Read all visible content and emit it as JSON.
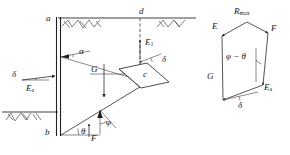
{
  "figure": {
    "stroke_color": "#2b2b2b",
    "background": "#ffffff"
  },
  "wall_diagram": {
    "name": "retaining-wall-diagram",
    "points": [
      {
        "id": "a",
        "label": "a",
        "x": 46,
        "y": 14,
        "desc": "top of wall"
      },
      {
        "id": "b",
        "label": "b",
        "x": 45,
        "y": 131,
        "desc": "toe of wall"
      },
      {
        "id": "c",
        "label": "c",
        "x": 143,
        "y": 76,
        "desc": "anchor head"
      },
      {
        "id": "d",
        "label": "d",
        "x": 140,
        "y": 12,
        "desc": "ground surface point"
      }
    ],
    "forces": [
      {
        "id": "Ea_left",
        "label": "E",
        "sub": "a",
        "x": 31,
        "y": 86,
        "desc": "active earth pressure on wall"
      },
      {
        "id": "G",
        "label": "G",
        "sub": "",
        "x": 93,
        "y": 69,
        "desc": "weight of soil wedge"
      },
      {
        "id": "E1",
        "label": "E",
        "sub": "1",
        "x": 148,
        "y": 44,
        "desc": "anchor force resultant"
      },
      {
        "id": "F",
        "label": "F",
        "sub": "",
        "x": 93,
        "y": 137,
        "desc": "reaction on slip plane"
      }
    ],
    "angles": [
      {
        "id": "alpha",
        "label": "α",
        "x": 79,
        "y": 54,
        "desc": "wedge angle at wall"
      },
      {
        "id": "delta_left",
        "label": "δ",
        "x": 26,
        "y": 71,
        "desc": "wall friction angle"
      },
      {
        "id": "delta_mid",
        "label": "δ",
        "x": 163,
        "y": 61,
        "desc": "anchor inclination"
      },
      {
        "id": "theta",
        "label": "θ",
        "x": 83,
        "y": 132,
        "desc": "slip surface angle"
      },
      {
        "id": "phi",
        "label": "φ",
        "x": 107,
        "y": 124,
        "desc": "internal friction angle"
      }
    ]
  },
  "force_polygon": {
    "name": "force-polygon",
    "vertices": [
      {
        "label": "E",
        "sub": "",
        "x": 213,
        "y": 26
      },
      {
        "label": "R",
        "sub": "max",
        "x": 238,
        "y": 14
      },
      {
        "label": "F",
        "sub": "",
        "x": 271,
        "y": 27
      },
      {
        "label": "E",
        "sub": "a",
        "x": 265,
        "y": 91
      },
      {
        "label": "G",
        "sub": "",
        "x": 209,
        "y": 77
      }
    ],
    "interior_label": "φ − θ",
    "interior_x": 229,
    "interior_y": 57,
    "bottom_angle_label": "δ",
    "bottom_angle_x": 239,
    "bottom_angle_y": 106
  }
}
